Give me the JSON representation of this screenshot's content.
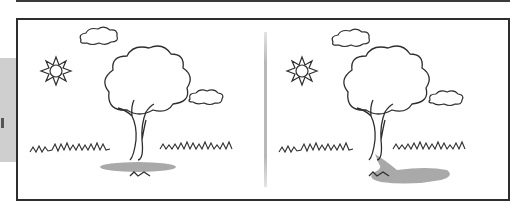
{
  "illustration": {
    "description": "Side-by-side comparison of a tree with its shadow under the sun",
    "panels": [
      {
        "id": "left",
        "shadow": "directly beneath tree",
        "elements": [
          "sun",
          "cloud",
          "tree",
          "cloud",
          "grass",
          "shadow"
        ]
      },
      {
        "id": "right",
        "shadow": "cast to the right of tree",
        "elements": [
          "sun",
          "cloud",
          "tree",
          "cloud",
          "grass",
          "shadow"
        ]
      }
    ]
  },
  "colors": {
    "line": "#2e2e2e",
    "shadow": "#a9a9a9",
    "side_tab": "#cfcfcf",
    "background": "#ffffff"
  }
}
